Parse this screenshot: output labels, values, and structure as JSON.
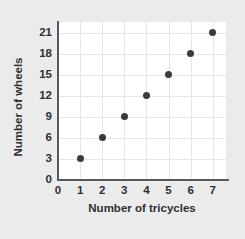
{
  "chart_data": {
    "type": "scatter",
    "title": "",
    "xlabel": "Number of tricycles",
    "ylabel": "Number of wheels",
    "x": [
      1,
      2,
      3,
      4,
      5,
      6,
      7
    ],
    "values": [
      3,
      6,
      9,
      12,
      15,
      18,
      21
    ],
    "points": [
      {
        "x": 1,
        "y": 3
      },
      {
        "x": 2,
        "y": 6
      },
      {
        "x": 3,
        "y": 9
      },
      {
        "x": 4,
        "y": 12
      },
      {
        "x": 5,
        "y": 15
      },
      {
        "x": 6,
        "y": 18
      },
      {
        "x": 7,
        "y": 21
      }
    ],
    "xticks": [
      "0",
      "1",
      "2",
      "3",
      "4",
      "5",
      "6",
      "7"
    ],
    "yticks": [
      "0",
      "3",
      "6",
      "9",
      "12",
      "15",
      "18",
      "21"
    ],
    "xlim": [
      0,
      7.6
    ],
    "ylim": [
      0,
      22.5
    ],
    "grid": true,
    "legend": false,
    "colors": {
      "background": "#ebebeb",
      "plot_background": "#ffffff",
      "marker": "#3b3b3f",
      "axis": "#55585c",
      "gridline": "#e6e6e6",
      "text": "#2f2f33"
    }
  }
}
